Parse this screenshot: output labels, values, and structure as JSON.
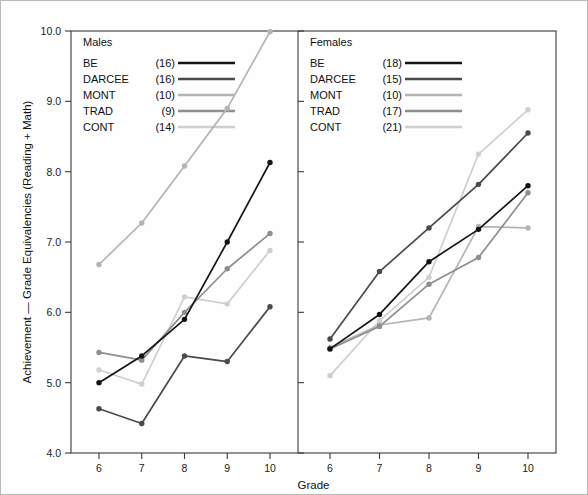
{
  "chart_data": {
    "type": "line",
    "title": "",
    "xlabel": "Grade",
    "ylabel": "Achievement — Grade Equivalencies (Reading + Math)",
    "x": [
      6,
      7,
      8,
      9,
      10
    ],
    "xtick_labels": [
      "6",
      "7",
      "8",
      "9",
      "10"
    ],
    "ytick_labels": [
      "4.0",
      "5.0",
      "6.0",
      "7.0",
      "8.0",
      "9.0",
      "10.0"
    ],
    "yticks": [
      4.0,
      5.0,
      6.0,
      7.0,
      8.0,
      9.0,
      10.0
    ],
    "ylim": [
      4.0,
      10.0
    ],
    "xlim": [
      5.55,
      10.45
    ],
    "grid": false,
    "legend_position": "top-left inside each panel",
    "panels": [
      {
        "name": "males",
        "label": "Males",
        "series": [
          {
            "name": "BE",
            "n_label": "(16)",
            "n": 16,
            "color": "#141414",
            "values": [
              5.0,
              5.38,
              5.9,
              7.0,
              8.13
            ]
          },
          {
            "name": "DARCEE",
            "n_label": "(16)",
            "n": 16,
            "color": "#4a4a4a",
            "values": [
              4.63,
              4.42,
              5.38,
              5.3,
              6.08
            ]
          },
          {
            "name": "MONT",
            "n_label": "(10)",
            "n": 10,
            "color": "#b4b4b4",
            "values": [
              6.68,
              7.27,
              8.08,
              8.9,
              9.99
            ]
          },
          {
            "name": "TRAD",
            "n_label": "(9)",
            "n": 9,
            "color": "#8e8e8e",
            "values": [
              5.43,
              5.32,
              6.0,
              6.62,
              7.12
            ]
          },
          {
            "name": "CONT",
            "n_label": "(14)",
            "n": 14,
            "color": "#cfcfcf",
            "values": [
              5.18,
              4.98,
              6.22,
              6.12,
              6.88
            ]
          }
        ]
      },
      {
        "name": "females",
        "label": "Females",
        "series": [
          {
            "name": "BE",
            "n_label": "(18)",
            "n": 18,
            "color": "#141414",
            "values": [
              5.48,
              5.97,
              6.72,
              7.18,
              7.8
            ]
          },
          {
            "name": "DARCEE",
            "n_label": "(15)",
            "n": 15,
            "color": "#4a4a4a",
            "values": [
              5.62,
              6.58,
              7.2,
              7.82,
              8.55
            ]
          },
          {
            "name": "MONT",
            "n_label": "(10)",
            "n": 10,
            "color": "#b4b4b4",
            "values": [
              5.5,
              5.82,
              5.92,
              7.22,
              7.2
            ]
          },
          {
            "name": "TRAD",
            "n_label": "(17)",
            "n": 17,
            "color": "#8e8e8e",
            "values": [
              5.48,
              5.8,
              6.4,
              6.78,
              7.7
            ]
          },
          {
            "name": "CONT",
            "n_label": "(21)",
            "n": 21,
            "color": "#cfcfcf",
            "values": [
              5.1,
              5.88,
              6.5,
              8.25,
              8.88
            ]
          }
        ]
      }
    ]
  }
}
